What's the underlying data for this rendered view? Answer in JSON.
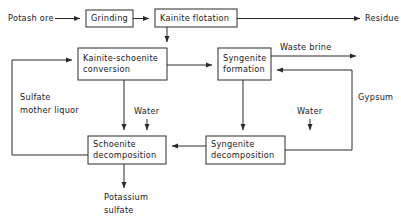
{
  "diagram": {
    "type": "process-flow-diagram",
    "colors": {
      "line": "#2a2a2a",
      "box_fill": "#ffffff",
      "background": "#ffffff",
      "text": "#1a1a1a"
    },
    "nodes": [
      {
        "id": "grinding",
        "label": "Grinding",
        "lines": [
          "Grinding"
        ],
        "x": 86,
        "y": 10,
        "w": 47,
        "h": 17
      },
      {
        "id": "kainite_flotation",
        "label": "Kainite flotation",
        "lines": [
          "Kainite flotation"
        ],
        "x": 155,
        "y": 9,
        "w": 82,
        "h": 18
      },
      {
        "id": "kainite_schoenite_conversion",
        "label": "Kainite-schoenite conversion",
        "lines": [
          "Kainite-schoenite",
          "conversion"
        ],
        "x": 78,
        "y": 48,
        "w": 89,
        "h": 32
      },
      {
        "id": "syngenite_formation",
        "label": "Syngenite formation",
        "lines": [
          "Syngenite",
          "formation"
        ],
        "x": 218,
        "y": 48,
        "w": 53,
        "h": 32
      },
      {
        "id": "schoenite_decomposition",
        "label": "Schoenite decomposition",
        "lines": [
          "Schoenite",
          "decomposition"
        ],
        "x": 88,
        "y": 136,
        "w": 78,
        "h": 28
      },
      {
        "id": "syngenite_decomposition",
        "label": "Syngenite decomposition",
        "lines": [
          "Syngenite",
          "decomposition"
        ],
        "x": 206,
        "y": 136,
        "w": 79,
        "h": 28
      }
    ],
    "stream_labels": [
      {
        "id": "potash_ore",
        "text": "Potash ore",
        "x": 8,
        "y": 21,
        "anchor": "start"
      },
      {
        "id": "residue",
        "text": "Residue",
        "x": 365,
        "y": 21,
        "anchor": "start"
      },
      {
        "id": "waste_brine",
        "text": "Waste brine",
        "x": 280,
        "y": 50,
        "anchor": "start"
      },
      {
        "id": "gypsum",
        "text": "Gypsum",
        "x": 358,
        "y": 100,
        "anchor": "start"
      },
      {
        "id": "sulfate_mother_liquor_1",
        "text": "Sulfate",
        "x": 20,
        "y": 100,
        "anchor": "start"
      },
      {
        "id": "sulfate_mother_liquor_2",
        "text": "mother liquor",
        "x": 20,
        "y": 113,
        "anchor": "start"
      },
      {
        "id": "water_left",
        "text": "Water",
        "x": 134,
        "y": 114,
        "anchor": "start"
      },
      {
        "id": "water_right",
        "text": "Water",
        "x": 297,
        "y": 114,
        "anchor": "start"
      },
      {
        "id": "potassium_sulfate_1",
        "text": "Potassium",
        "x": 104,
        "y": 200,
        "anchor": "start"
      },
      {
        "id": "potassium_sulfate_2",
        "text": "sulfate",
        "x": 104,
        "y": 213,
        "anchor": "start"
      }
    ],
    "connections": [
      {
        "id": "ore-to-grinding",
        "from": "potash-ore-inlet",
        "to": "grinding",
        "path": "M 55 18.5 L 80 18.5",
        "arrow": "end"
      },
      {
        "id": "grinding-to-flotation",
        "from": "grinding",
        "to": "kainite_flotation",
        "path": "M 133 18.5 L 149 18.5",
        "arrow": "end"
      },
      {
        "id": "flotation-to-residue",
        "from": "kainite_flotation",
        "to": "residue-outlet",
        "path": "M 237 18.5 L 360 18.5",
        "arrow": "end"
      },
      {
        "id": "flotation-to-conversion",
        "from": "kainite_flotation",
        "to": "kainite_schoenite_conversion",
        "path": "M 167 27 L 167 42",
        "arrow": "end"
      },
      {
        "id": "conversion-to-formation",
        "from": "kainite_schoenite_conversion",
        "to": "syngenite_formation",
        "path": "M 167 65 L 212 65",
        "arrow": "end"
      },
      {
        "id": "formation-to-waste-brine",
        "from": "syngenite_formation",
        "to": "waste-brine-outlet",
        "path": "M 271 56 L 356 56",
        "arrow": "end"
      },
      {
        "id": "conversion-to-schoenite-decomp",
        "from": "kainite_schoenite_conversion",
        "to": "schoenite_decomposition",
        "path": "M 124 80 L 124 130",
        "arrow": "end"
      },
      {
        "id": "water-to-schoenite-decomp",
        "from": "water_left",
        "to": "schoenite_decomposition",
        "path": "M 147 119 L 147 130",
        "arrow": "end"
      },
      {
        "id": "formation-to-syngenite-decomp",
        "from": "syngenite_formation",
        "to": "syngenite_decomposition",
        "path": "M 243 80 L 243 130",
        "arrow": "end"
      },
      {
        "id": "water-to-syngenite-decomp",
        "from": "water_right",
        "to": "syngenite_decomposition",
        "path": "M 310 119 L 310 130",
        "arrow": "end"
      },
      {
        "id": "syngenite-decomp-to-schoenite-decomp",
        "from": "syngenite_decomposition",
        "to": "schoenite_decomposition",
        "path": "M 206 146 L 172 146",
        "arrow": "end"
      },
      {
        "id": "schoenite-decomp-to-product",
        "from": "schoenite_decomposition",
        "to": "potassium-sulfate-outlet",
        "path": "M 124 164 L 124 188",
        "arrow": "end"
      },
      {
        "id": "sulfate-mother-liquor-recycle",
        "from": "schoenite_decomposition",
        "to": "kainite_schoenite_conversion",
        "path": "M 88 155 L 12 155 L 12 60 L 72 60",
        "arrow": "end"
      },
      {
        "id": "gypsum-recycle",
        "from": "syngenite_decomposition",
        "to": "syngenite_formation",
        "path": "M 285 150 L 352 150 L 352 70 L 277 70",
        "arrow": "end"
      }
    ]
  }
}
